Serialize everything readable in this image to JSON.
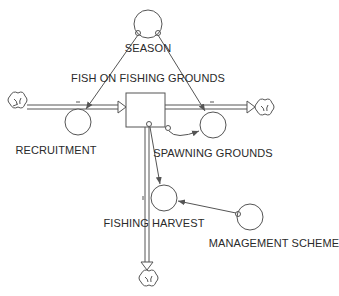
{
  "diagram": {
    "type": "stock-and-flow",
    "stock": {
      "label": "FISH ON FISHING GROUNDS"
    },
    "flows": [
      {
        "label": "RECRUITMENT"
      },
      {
        "label": "SPAWNING GROUNDS"
      },
      {
        "label": "FISHING HARVEST"
      }
    ],
    "auxiliaries": [
      {
        "label": "SEASON"
      },
      {
        "label": "MANAGEMENT SCHEME"
      }
    ],
    "colors": {
      "line": "#555555",
      "text": "#2a2a2a",
      "background": "#ffffff"
    }
  }
}
